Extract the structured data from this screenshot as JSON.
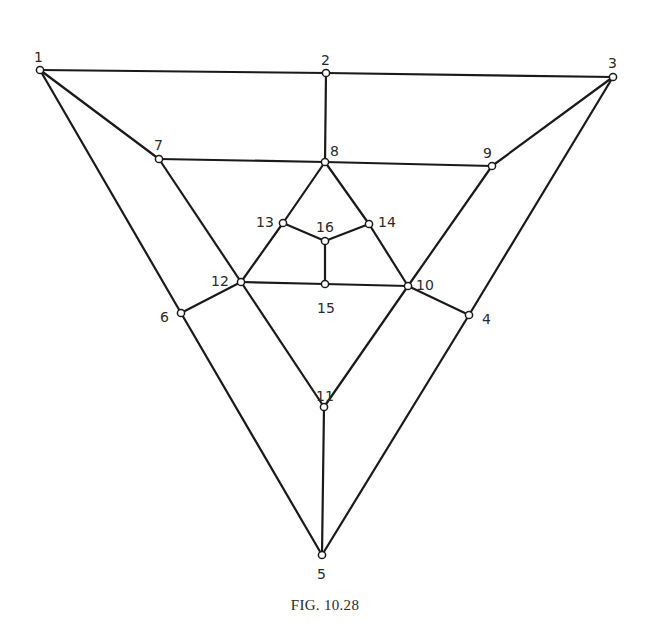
{
  "figure": {
    "caption": "FIG. 10.28",
    "colors": {
      "line": "#1a1a1a",
      "node_fill": "#ffffff",
      "text": "#2a2a2a",
      "background": "#ffffff"
    },
    "nodes": [
      {
        "id": "1",
        "x": 40,
        "y": 70,
        "lx": 34,
        "ly": 58
      },
      {
        "id": "2",
        "x": 326,
        "y": 73,
        "lx": 321,
        "ly": 61
      },
      {
        "id": "3",
        "x": 613,
        "y": 77,
        "lx": 608,
        "ly": 64
      },
      {
        "id": "4",
        "x": 469,
        "y": 315,
        "lx": 482,
        "ly": 320
      },
      {
        "id": "5",
        "x": 322,
        "y": 555,
        "lx": 317,
        "ly": 575
      },
      {
        "id": "6",
        "x": 181,
        "y": 313,
        "lx": 160,
        "ly": 318
      },
      {
        "id": "7",
        "x": 159,
        "y": 159,
        "lx": 154,
        "ly": 146
      },
      {
        "id": "8",
        "x": 325,
        "y": 162,
        "lx": 330,
        "ly": 152
      },
      {
        "id": "9",
        "x": 492,
        "y": 166,
        "lx": 483,
        "ly": 154
      },
      {
        "id": "10",
        "x": 408,
        "y": 286,
        "lx": 416,
        "ly": 286
      },
      {
        "id": "11",
        "x": 324,
        "y": 407,
        "lx": 316,
        "ly": 397
      },
      {
        "id": "12",
        "x": 241,
        "y": 282,
        "lx": 211,
        "ly": 282
      },
      {
        "id": "13",
        "x": 283,
        "y": 223,
        "lx": 256,
        "ly": 223
      },
      {
        "id": "14",
        "x": 369,
        "y": 224,
        "lx": 378,
        "ly": 223
      },
      {
        "id": "15",
        "x": 325,
        "y": 284,
        "lx": 317,
        "ly": 309
      },
      {
        "id": "16",
        "x": 325,
        "y": 241,
        "lx": 316,
        "ly": 228
      }
    ],
    "edges": [
      [
        "1",
        "2"
      ],
      [
        "2",
        "3"
      ],
      [
        "2",
        "8"
      ],
      [
        "1",
        "7"
      ],
      [
        "1",
        "6"
      ],
      [
        "3",
        "9"
      ],
      [
        "3",
        "4"
      ],
      [
        "7",
        "8"
      ],
      [
        "8",
        "9"
      ],
      [
        "7",
        "12"
      ],
      [
        "9",
        "10"
      ],
      [
        "8",
        "13"
      ],
      [
        "8",
        "14"
      ],
      [
        "13",
        "16"
      ],
      [
        "14",
        "16"
      ],
      [
        "16",
        "15"
      ],
      [
        "13",
        "12"
      ],
      [
        "14",
        "10"
      ],
      [
        "12",
        "15"
      ],
      [
        "15",
        "10"
      ],
      [
        "12",
        "6"
      ],
      [
        "10",
        "4"
      ],
      [
        "12",
        "11"
      ],
      [
        "10",
        "11"
      ],
      [
        "11",
        "5"
      ],
      [
        "6",
        "5"
      ],
      [
        "4",
        "5"
      ]
    ]
  }
}
